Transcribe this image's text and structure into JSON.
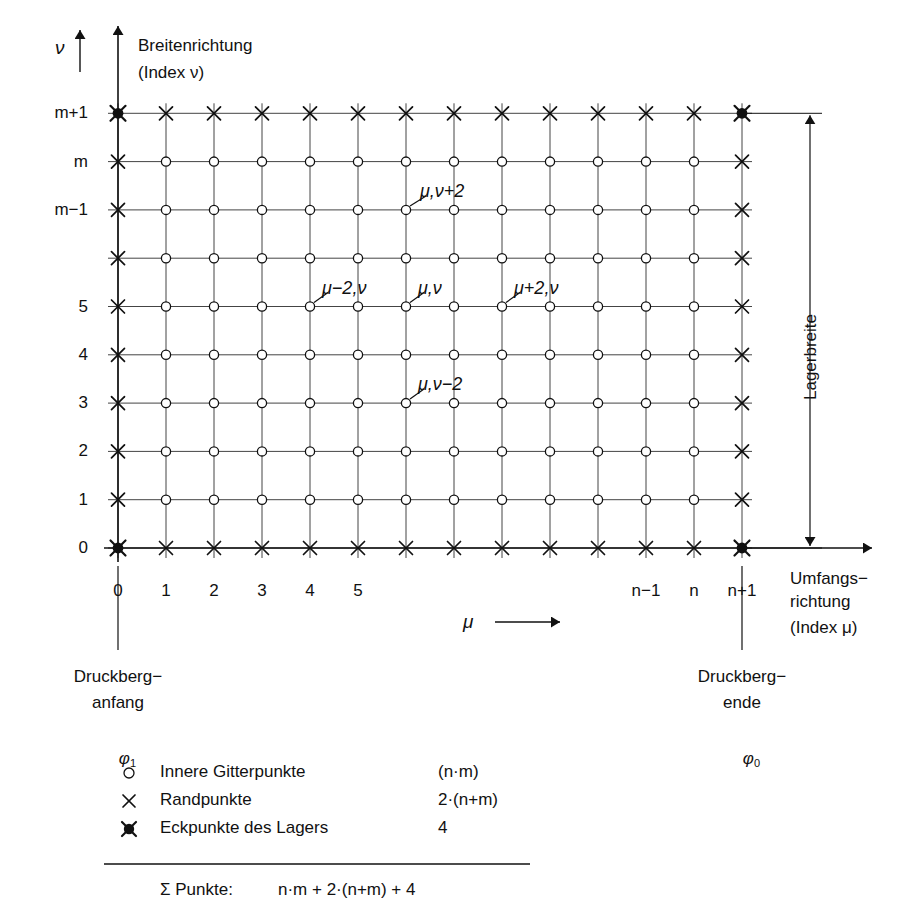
{
  "diagram": {
    "title_top": "Breitenrichtung",
    "title_top_sub": "(Index ν)",
    "y_axis_symbol": "ν",
    "x_axis_symbol": "μ",
    "x_axis_title_line1": "Umfangs−",
    "x_axis_title_line2": "richtung",
    "x_axis_title_line3": "(Index μ)",
    "right_dimension_label": "Lagerbreite",
    "left_callout_line1": "Druckberg−",
    "left_callout_line2": "anfang",
    "left_callout_symbol": "φ",
    "left_callout_subscript": "1",
    "right_callout_line1": "Druckberg−",
    "right_callout_line2": "ende",
    "right_callout_symbol": "φ",
    "right_callout_subscript": "0"
  },
  "axes": {
    "x_ticks": [
      {
        "col": 0,
        "label": "0"
      },
      {
        "col": 1,
        "label": "1"
      },
      {
        "col": 2,
        "label": "2"
      },
      {
        "col": 3,
        "label": "3"
      },
      {
        "col": 4,
        "label": "4"
      },
      {
        "col": 5,
        "label": "5"
      },
      {
        "col": 6,
        "label": ""
      },
      {
        "col": 7,
        "label": ""
      },
      {
        "col": 8,
        "label": ""
      },
      {
        "col": 9,
        "label": ""
      },
      {
        "col": 10,
        "label": ""
      },
      {
        "col": 11,
        "label": "n−1"
      },
      {
        "col": 12,
        "label": "n"
      },
      {
        "col": 13,
        "label": "n+1"
      }
    ],
    "y_ticks": [
      {
        "row": 0,
        "label": "0"
      },
      {
        "row": 1,
        "label": "1"
      },
      {
        "row": 2,
        "label": "2"
      },
      {
        "row": 3,
        "label": "3"
      },
      {
        "row": 4,
        "label": "4"
      },
      {
        "row": 5,
        "label": "5"
      },
      {
        "row": 6,
        "label": ""
      },
      {
        "row": 7,
        "label": "m−1"
      },
      {
        "row": 8,
        "label": "m"
      },
      {
        "row": 9,
        "label": "m+1"
      }
    ]
  },
  "grid": {
    "columns": 14,
    "rows": 10,
    "x0": 118,
    "y0": 548,
    "dx": 48,
    "dy": 48.3
  },
  "annotations": [
    {
      "text": "μ,ν+2",
      "col": 6,
      "row": 7,
      "label_dx": 14,
      "label_dy": -26
    },
    {
      "text": "μ−2,ν",
      "col": 4,
      "row": 5,
      "label_dx": 12,
      "label_dy": -26
    },
    {
      "text": "μ,ν",
      "col": 6,
      "row": 5,
      "label_dx": 12,
      "label_dy": -26
    },
    {
      "text": "μ+2,ν",
      "col": 8,
      "row": 5,
      "label_dx": 12,
      "label_dy": -26
    },
    {
      "text": "μ,ν−2",
      "col": 6,
      "row": 3,
      "label_dx": 12,
      "label_dy": -26
    }
  ],
  "legend": {
    "rows": [
      {
        "marker": "circle-marker",
        "label": "Innere Gitterpunkte",
        "count": "(n·m)"
      },
      {
        "marker": "cross-marker",
        "label": "Randpunkte",
        "count": "2·(n+m)"
      },
      {
        "marker": "corner-marker",
        "label": "Eckpunkte des Lagers",
        "count": "4"
      }
    ],
    "total_label": "Σ Punkte:",
    "total_value": "n·m + 2·(n+m) + 4"
  },
  "colors": {
    "ink": "#111111",
    "grid": "#444444",
    "background": "#ffffff"
  }
}
